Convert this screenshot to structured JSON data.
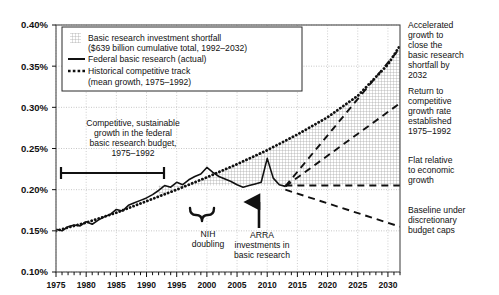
{
  "chart_data": {
    "type": "line",
    "title": "",
    "xlabel": "",
    "ylabel": "",
    "xlim": [
      1975,
      2032
    ],
    "ylim": [
      0.1,
      0.4
    ],
    "ytick_labels": [
      "0.10%",
      "0.15%",
      "0.20%",
      "0.25%",
      "0.30%",
      "0.35%",
      "0.40%"
    ],
    "ytick_values": [
      0.1,
      0.15,
      0.2,
      0.25,
      0.3,
      0.35,
      0.4
    ],
    "xtick_labels": [
      "1975",
      "1980",
      "1985",
      "1990",
      "1995",
      "2000",
      "2005",
      "2010",
      "2015",
      "2020",
      "2025",
      "2030"
    ],
    "xtick_values": [
      1975,
      1980,
      1985,
      1990,
      1995,
      2000,
      2005,
      2010,
      2015,
      2020,
      2025,
      2030
    ],
    "minor_xtick_interval": 1,
    "grid": true,
    "legend_position": "top-left",
    "series": [
      {
        "name": "Federal basic research (actual)",
        "style": "solid",
        "x": [
          1975,
          1976,
          1977,
          1978,
          1979,
          1980,
          1981,
          1982,
          1983,
          1984,
          1985,
          1986,
          1987,
          1988,
          1989,
          1990,
          1991,
          1992,
          1993,
          1994,
          1995,
          1996,
          1997,
          1998,
          1999,
          2000,
          2001,
          2002,
          2003,
          2004,
          2005,
          2006,
          2007,
          2008,
          2009,
          2010,
          2011,
          2012,
          2013
        ],
        "values": [
          0.152,
          0.15,
          0.155,
          0.157,
          0.156,
          0.161,
          0.158,
          0.163,
          0.167,
          0.17,
          0.176,
          0.174,
          0.181,
          0.184,
          0.187,
          0.19,
          0.194,
          0.199,
          0.205,
          0.203,
          0.209,
          0.206,
          0.212,
          0.216,
          0.219,
          0.227,
          0.221,
          0.216,
          0.213,
          0.21,
          0.206,
          0.203,
          0.205,
          0.207,
          0.209,
          0.238,
          0.214,
          0.206,
          0.204
        ]
      },
      {
        "name": "Historical competitive track (mean growth, 1975–1992)",
        "style": "dotted",
        "x": [
          1975,
          1980,
          1985,
          1990,
          1995,
          2000,
          2005,
          2010,
          2015,
          2020,
          2025,
          2030,
          2032
        ],
        "values": [
          0.15,
          0.16,
          0.172,
          0.186,
          0.2,
          0.215,
          0.231,
          0.248,
          0.267,
          0.288,
          0.314,
          0.352,
          0.375
        ]
      },
      {
        "name": "Accelerated growth to close the basic research shortfall by 2032",
        "style": "dashed",
        "x": [
          2013,
          2032
        ],
        "values": [
          0.204,
          0.372
        ]
      },
      {
        "name": "Return to competitive growth rate established 1975–1992",
        "style": "dashed",
        "x": [
          2013,
          2032
        ],
        "values": [
          0.204,
          0.305
        ]
      },
      {
        "name": "Flat relative to economic growth",
        "style": "dashed",
        "x": [
          2013,
          2032
        ],
        "values": [
          0.205,
          0.205
        ]
      },
      {
        "name": "Baseline under discretionary budget caps",
        "style": "dashed",
        "x": [
          2013,
          2032
        ],
        "values": [
          0.2,
          0.155
        ]
      }
    ],
    "shaded_region": {
      "name": "Basic research investment shortfall",
      "label": "$639 billion cumulative total, 1992–2032",
      "upper_series": "Historical competitive track (mean growth, 1975–1992)",
      "lower_bound": 0.205,
      "x_from": 1992,
      "x_to": 2032
    }
  },
  "legend": {
    "items": [
      {
        "marker": "hatch-swatch",
        "line1": "Basic research investment shortfall",
        "line2": "($639 billion cumulative total, 1992–2032)"
      },
      {
        "marker": "solid-line",
        "line1": "Federal basic research (actual)",
        "line2": ""
      },
      {
        "marker": "dotted-line",
        "line1": "Historical competitive track",
        "line2": "(mean growth, 1975–1992)"
      }
    ]
  },
  "annotations": {
    "left": {
      "lines": [
        "Competitive, sustainable",
        "growth in the federal",
        "basic research budget,",
        "1975–1992"
      ],
      "bar_from": 1975,
      "bar_to": 1992
    },
    "bottom": [
      {
        "name": "nih-doubling",
        "lines": [
          "NIH",
          "doubling"
        ],
        "marker": "brace"
      },
      {
        "name": "arra-investments",
        "lines": [
          "ARRA",
          "investments in",
          "basic research"
        ],
        "marker": "arrow-up"
      }
    ],
    "right": [
      {
        "name": "accelerated-growth",
        "lines": [
          "Accelerated",
          "growth to",
          "close the",
          "basic research",
          "shortfall by",
          "2032"
        ]
      },
      {
        "name": "return-to-competitive",
        "lines": [
          "Return to",
          "competitive",
          "growth rate",
          "established",
          "1975–1992"
        ]
      },
      {
        "name": "flat-relative",
        "lines": [
          "Flat relative",
          "to economic",
          "growth"
        ]
      },
      {
        "name": "baseline-caps",
        "lines": [
          "Baseline under",
          "discretionary",
          "budget caps"
        ]
      }
    ]
  },
  "colors": {
    "ink": "#111111",
    "grid": "#b9b9b9",
    "hatch": "#9a9a9a"
  }
}
